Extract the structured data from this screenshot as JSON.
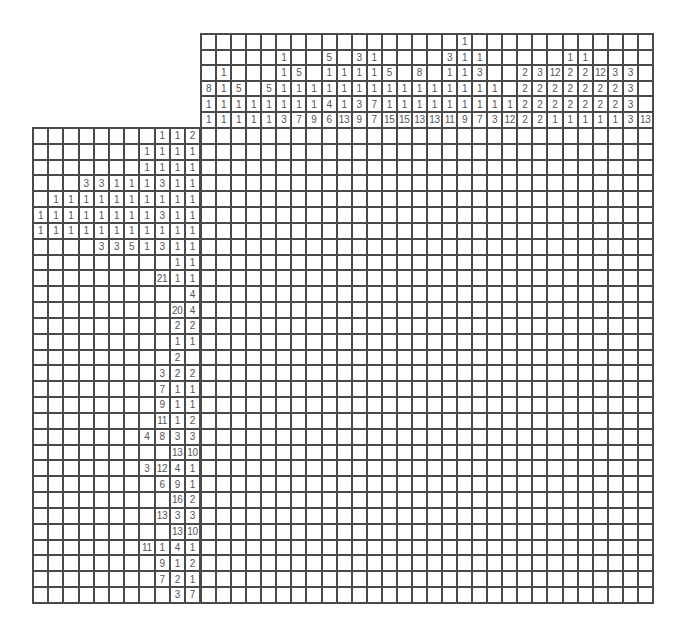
{
  "puzzle": {
    "type": "nonogram",
    "rows": 30,
    "cols": 30,
    "colors": {
      "line": "#4a4a4a",
      "text": "#555555",
      "background": "#ffffff"
    },
    "column_clues": [
      [
        8,
        1,
        1
      ],
      [
        1,
        1,
        1,
        1
      ],
      [
        5,
        1,
        1
      ],
      [
        1,
        1
      ],
      [
        5,
        1,
        1
      ],
      [
        1,
        1,
        1,
        1,
        3
      ],
      [
        5,
        1,
        1,
        7
      ],
      [
        1,
        1,
        9
      ],
      [
        5,
        1,
        1,
        4,
        6
      ],
      [
        1,
        1,
        1,
        13
      ],
      [
        3,
        1,
        1,
        3,
        9
      ],
      [
        1,
        1,
        1,
        7,
        7
      ],
      [
        5,
        1,
        1,
        15
      ],
      [
        1,
        1,
        15
      ],
      [
        8,
        1,
        1,
        13
      ],
      [
        1,
        1,
        13
      ],
      [
        3,
        1,
        1,
        1,
        11
      ],
      [
        1,
        1,
        1,
        1,
        1,
        9
      ],
      [
        1,
        3,
        1,
        1,
        7
      ],
      [
        1,
        1,
        3
      ],
      [
        1,
        12
      ],
      [
        2,
        2,
        2,
        2
      ],
      [
        3,
        2,
        2,
        2
      ],
      [
        12,
        2,
        2,
        1
      ],
      [
        1,
        2,
        2,
        2,
        1
      ],
      [
        1,
        2,
        2,
        2,
        1
      ],
      [
        12,
        2,
        2,
        1
      ],
      [
        3,
        2,
        2,
        1
      ],
      [
        3,
        3,
        3,
        3
      ],
      [
        13
      ]
    ],
    "row_clues": [
      [
        1,
        1,
        2
      ],
      [
        1,
        1,
        1,
        1
      ],
      [
        1,
        1,
        1,
        1
      ],
      [
        3,
        3,
        1,
        1,
        1,
        3,
        1,
        1
      ],
      [
        1,
        1,
        1,
        1,
        1,
        1,
        1,
        1,
        1,
        1
      ],
      [
        1,
        1,
        1,
        1,
        1,
        1,
        1,
        1,
        3,
        1,
        1
      ],
      [
        1,
        1,
        1,
        1,
        1,
        1,
        1,
        1,
        1,
        1,
        1
      ],
      [
        3,
        3,
        5,
        1,
        3,
        1,
        1
      ],
      [
        1,
        1
      ],
      [
        21,
        1,
        1
      ],
      [
        4
      ],
      [
        20,
        4
      ],
      [
        2,
        2
      ],
      [
        1,
        1
      ],
      [
        2
      ],
      [
        3,
        2,
        2
      ],
      [
        7,
        1,
        1
      ],
      [
        9,
        1,
        1
      ],
      [
        11,
        1,
        2
      ],
      [
        4,
        8,
        3,
        3
      ],
      [
        13,
        10
      ],
      [
        3,
        12,
        4,
        1
      ],
      [
        6,
        9,
        1
      ],
      [
        16,
        2
      ],
      [
        13,
        3,
        3
      ],
      [
        13,
        10
      ],
      [
        11,
        1,
        4,
        1
      ],
      [
        9,
        1,
        2
      ],
      [
        7,
        2,
        1
      ],
      [
        3,
        7
      ]
    ],
    "row_clue_alignment_overrides": {
      "15": "second_to_last"
    }
  }
}
